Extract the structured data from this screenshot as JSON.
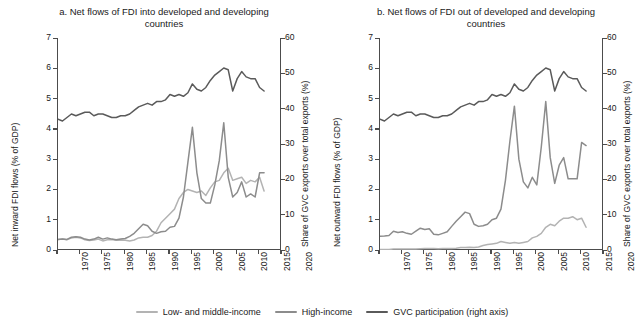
{
  "legend": {
    "items": [
      {
        "label": "Low- and middle-income",
        "color": "#b3b3b3"
      },
      {
        "label": "High-income",
        "color": "#8c8c8c"
      },
      {
        "label": "GVC participation (right axis)",
        "color": "#5a5a5a"
      }
    ]
  },
  "chart_data": [
    {
      "type": "line",
      "panel": "a",
      "title": "a. Net flows of FDI into developed and developing countries",
      "xlabel": "",
      "ylabel": "Net inward FDI flows (% of GDP)",
      "ylabel_right": "Share of GVC exports over total exports (%)",
      "xlim": [
        1970,
        2020
      ],
      "ylim": [
        0,
        7
      ],
      "ylim_right": [
        0,
        60
      ],
      "xticks": [
        1970,
        1975,
        1980,
        1985,
        1990,
        1995,
        2000,
        2005,
        2010,
        2015,
        2020
      ],
      "yticks": [
        0,
        1,
        2,
        3,
        4,
        5,
        6,
        7
      ],
      "yticks_right": [
        0,
        10,
        20,
        30,
        40,
        50,
        60
      ],
      "grid": false,
      "legend_position": "bottom",
      "x": [
        1970,
        1971,
        1972,
        1973,
        1974,
        1975,
        1976,
        1977,
        1978,
        1979,
        1980,
        1981,
        1982,
        1983,
        1984,
        1985,
        1986,
        1987,
        1988,
        1989,
        1990,
        1991,
        1992,
        1993,
        1994,
        1995,
        1996,
        1997,
        1998,
        1999,
        2000,
        2001,
        2002,
        2003,
        2004,
        2005,
        2006,
        2007,
        2008,
        2009,
        2010,
        2011,
        2012,
        2013,
        2014,
        2015,
        2016
      ],
      "series": [
        {
          "name": "Low- and middle-income",
          "axis": "left",
          "color": "#b3b3b3",
          "values": [
            0.35,
            0.36,
            0.34,
            0.4,
            0.42,
            0.4,
            0.34,
            0.31,
            0.33,
            0.36,
            0.3,
            0.34,
            0.35,
            0.32,
            0.33,
            0.32,
            0.3,
            0.33,
            0.4,
            0.42,
            0.42,
            0.48,
            0.62,
            0.9,
            1.05,
            1.2,
            1.35,
            1.7,
            1.9,
            2.0,
            1.95,
            1.9,
            1.95,
            1.8,
            2.05,
            2.25,
            2.3,
            2.55,
            2.7,
            2.3,
            2.35,
            2.4,
            2.2,
            2.3,
            2.25,
            2.4,
            1.95
          ]
        },
        {
          "name": "High-income",
          "axis": "left",
          "color": "#8c8c8c",
          "values": [
            0.35,
            0.36,
            0.35,
            0.42,
            0.44,
            0.42,
            0.36,
            0.33,
            0.36,
            0.42,
            0.36,
            0.4,
            0.36,
            0.34,
            0.36,
            0.38,
            0.45,
            0.55,
            0.7,
            0.85,
            0.8,
            0.62,
            0.55,
            0.6,
            0.62,
            0.75,
            0.78,
            1.05,
            1.75,
            2.9,
            4.05,
            2.55,
            1.7,
            1.55,
            1.55,
            2.15,
            2.95,
            4.2,
            2.4,
            1.75,
            1.9,
            2.25,
            1.75,
            1.85,
            1.75,
            2.55,
            2.55
          ]
        },
        {
          "name": "GVC participation (right axis)",
          "axis": "right",
          "color": "#5a5a5a",
          "values": [
            37.0,
            36.5,
            37.5,
            38.5,
            38.0,
            38.5,
            39.0,
            39.0,
            38.0,
            38.5,
            38.5,
            38.0,
            37.5,
            37.5,
            38.0,
            38.0,
            38.5,
            39.5,
            40.5,
            41.0,
            41.5,
            41.0,
            42.0,
            42.0,
            42.5,
            44.0,
            43.5,
            44.0,
            43.5,
            44.5,
            47.0,
            45.5,
            45.0,
            46.0,
            48.0,
            49.5,
            50.5,
            51.5,
            51.0,
            45.0,
            48.5,
            50.5,
            49.0,
            48.5,
            48.5,
            46.0,
            45.0
          ]
        }
      ]
    },
    {
      "type": "line",
      "panel": "b",
      "title": "b. Net flows of FDI out of developed and developing countries",
      "xlabel": "",
      "ylabel": "Net outward FDI flows (% of GDP)",
      "ylabel_right": "Share of GVC exports over total exports (%)",
      "xlim": [
        1970,
        2020
      ],
      "ylim": [
        0,
        7
      ],
      "ylim_right": [
        0,
        60
      ],
      "xticks": [
        1970,
        1975,
        1980,
        1985,
        1990,
        1995,
        2000,
        2005,
        2010,
        2015,
        2020
      ],
      "yticks": [
        0,
        1,
        2,
        3,
        4,
        5,
        6,
        7
      ],
      "yticks_right": [
        0,
        10,
        20,
        30,
        40,
        50,
        60
      ],
      "grid": false,
      "legend_position": "bottom",
      "x": [
        1970,
        1971,
        1972,
        1973,
        1974,
        1975,
        1976,
        1977,
        1978,
        1979,
        1980,
        1981,
        1982,
        1983,
        1984,
        1985,
        1986,
        1987,
        1988,
        1989,
        1990,
        1991,
        1992,
        1993,
        1994,
        1995,
        1996,
        1997,
        1998,
        1999,
        2000,
        2001,
        2002,
        2003,
        2004,
        2005,
        2006,
        2007,
        2008,
        2009,
        2010,
        2011,
        2012,
        2013,
        2014,
        2015,
        2016
      ],
      "series": [
        {
          "name": "Low- and middle-income",
          "axis": "left",
          "color": "#b3b3b3",
          "values": [
            0.02,
            0.02,
            0.02,
            0.03,
            0.03,
            0.03,
            0.03,
            0.03,
            0.03,
            0.04,
            0.05,
            0.05,
            0.05,
            0.04,
            0.05,
            0.05,
            0.05,
            0.06,
            0.08,
            0.08,
            0.09,
            0.08,
            0.1,
            0.15,
            0.18,
            0.2,
            0.22,
            0.28,
            0.25,
            0.22,
            0.25,
            0.22,
            0.25,
            0.28,
            0.4,
            0.45,
            0.55,
            0.75,
            0.85,
            0.8,
            0.95,
            1.05,
            1.05,
            1.1,
            1.0,
            1.05,
            0.75
          ]
        },
        {
          "name": "High-income",
          "axis": "left",
          "color": "#8c8c8c",
          "values": [
            0.45,
            0.46,
            0.48,
            0.62,
            0.58,
            0.6,
            0.55,
            0.52,
            0.62,
            0.72,
            0.68,
            0.7,
            0.52,
            0.5,
            0.55,
            0.6,
            0.78,
            0.95,
            1.1,
            1.25,
            1.2,
            0.85,
            0.78,
            0.8,
            0.85,
            1.0,
            1.05,
            1.35,
            2.3,
            3.6,
            4.75,
            3.0,
            2.25,
            2.05,
            2.4,
            2.15,
            3.4,
            4.9,
            3.05,
            2.2,
            2.8,
            3.05,
            2.35,
            2.35,
            2.35,
            3.55,
            3.45
          ]
        },
        {
          "name": "GVC participation (right axis)",
          "axis": "right",
          "color": "#5a5a5a",
          "values": [
            37.0,
            36.5,
            37.5,
            38.5,
            38.0,
            38.5,
            39.0,
            39.0,
            38.0,
            38.5,
            38.5,
            38.0,
            37.5,
            37.5,
            38.0,
            38.0,
            38.5,
            39.5,
            40.5,
            41.0,
            41.5,
            41.0,
            42.0,
            42.0,
            42.5,
            44.0,
            43.5,
            44.0,
            43.5,
            44.5,
            47.0,
            45.5,
            45.0,
            46.0,
            48.0,
            49.5,
            50.5,
            51.5,
            51.0,
            45.0,
            48.5,
            50.5,
            49.0,
            48.5,
            48.5,
            46.0,
            45.0
          ]
        }
      ]
    }
  ]
}
